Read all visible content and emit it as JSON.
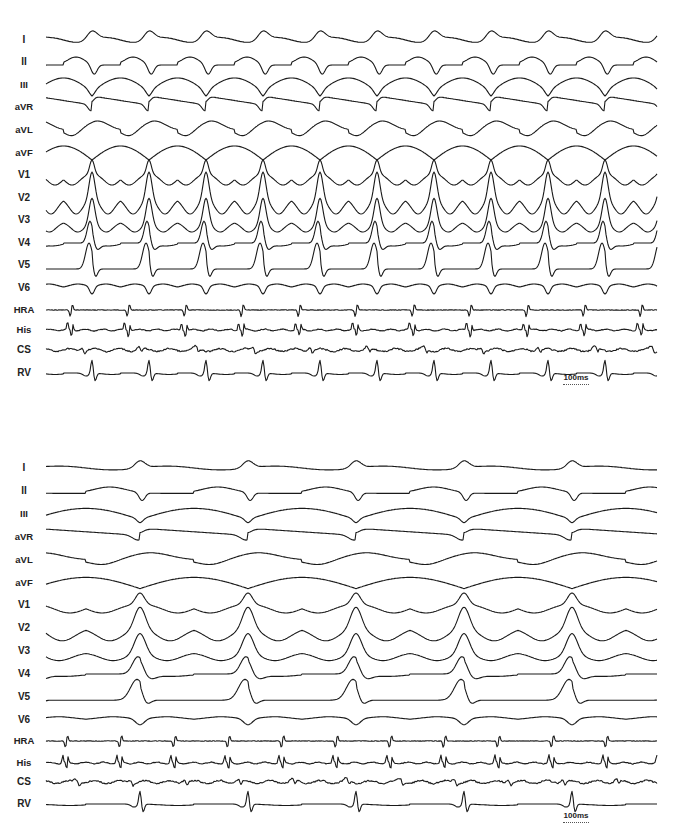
{
  "figure": {
    "panels": [
      {
        "id": "top",
        "description": "Wide QRS tachycardia, 1:1 AV relationship",
        "top": 0,
        "height": 400,
        "trace_start_x": 46,
        "trace_end_x": 657,
        "cycle_px": 57,
        "first_qrs_x": 92,
        "atrial_ratio": 1,
        "leads": [
          {
            "label": "I",
            "y": 40,
            "type": "ecg",
            "morph": "I"
          },
          {
            "label": "II",
            "y": 62,
            "type": "ecg",
            "morph": "II"
          },
          {
            "label": "III",
            "y": 85,
            "type": "ecg",
            "morph": "III"
          },
          {
            "label": "aVR",
            "y": 107,
            "type": "ecg",
            "morph": "aVR"
          },
          {
            "label": "aVL",
            "y": 130,
            "type": "ecg",
            "morph": "aVL"
          },
          {
            "label": "aVF",
            "y": 153,
            "type": "ecg",
            "morph": "aVF"
          },
          {
            "label": "V1",
            "y": 175,
            "type": "ecg",
            "morph": "V1"
          },
          {
            "label": "V2",
            "y": 198,
            "type": "ecg",
            "morph": "V2"
          },
          {
            "label": "V3",
            "y": 220,
            "type": "ecg",
            "morph": "V3"
          },
          {
            "label": "V4",
            "y": 243,
            "type": "ecg",
            "morph": "V4"
          },
          {
            "label": "V5",
            "y": 265,
            "type": "ecg",
            "morph": "V5"
          },
          {
            "label": "V6",
            "y": 288,
            "type": "ecg",
            "morph": "V6"
          },
          {
            "label": "HRA",
            "y": 310,
            "type": "egm",
            "morph": "HRA"
          },
          {
            "label": "His",
            "y": 330,
            "type": "egm",
            "morph": "His"
          },
          {
            "label": "CS",
            "y": 350,
            "type": "egm",
            "morph": "CS"
          },
          {
            "label": "RV",
            "y": 373,
            "type": "egm",
            "morph": "RV"
          }
        ],
        "scale_bar": {
          "label": "100ms",
          "x": 563,
          "y": 384,
          "width": 26
        }
      },
      {
        "id": "bottom",
        "description": "Same wide QRS morphology with 2:1 conduction (atrial cycle half of ventricular cycle)",
        "top": 0,
        "height": 837,
        "trace_start_x": 46,
        "trace_end_x": 657,
        "cycle_px": 108,
        "first_qrs_x": 140,
        "atrial_ratio": 2,
        "leads": [
          {
            "label": "I",
            "y": 468,
            "type": "ecg",
            "morph": "I"
          },
          {
            "label": "II",
            "y": 491,
            "type": "ecg",
            "morph": "II"
          },
          {
            "label": "III",
            "y": 514,
            "type": "ecg",
            "morph": "III"
          },
          {
            "label": "aVR",
            "y": 537,
            "type": "ecg",
            "morph": "aVR"
          },
          {
            "label": "aVL",
            "y": 560,
            "type": "ecg",
            "morph": "aVL"
          },
          {
            "label": "aVF",
            "y": 583,
            "type": "ecg",
            "morph": "aVF"
          },
          {
            "label": "V1",
            "y": 605,
            "type": "ecg",
            "morph": "V1"
          },
          {
            "label": "V2",
            "y": 628,
            "type": "ecg",
            "morph": "V2"
          },
          {
            "label": "V3",
            "y": 651,
            "type": "ecg",
            "morph": "V3"
          },
          {
            "label": "V4",
            "y": 674,
            "type": "ecg",
            "morph": "V4"
          },
          {
            "label": "V5",
            "y": 697,
            "type": "ecg",
            "morph": "V5"
          },
          {
            "label": "V6",
            "y": 720,
            "type": "ecg",
            "morph": "V6"
          },
          {
            "label": "HRA",
            "y": 741,
            "type": "egm",
            "morph": "HRA"
          },
          {
            "label": "His",
            "y": 763,
            "type": "egm",
            "morph": "His"
          },
          {
            "label": "CS",
            "y": 782,
            "type": "egm",
            "morph": "CS"
          },
          {
            "label": "RV",
            "y": 804,
            "type": "egm",
            "morph": "RV"
          }
        ],
        "scale_bar": {
          "label": "100ms",
          "x": 563,
          "y": 822,
          "width": 26
        }
      }
    ]
  },
  "chart_data": [
    {
      "type": "line",
      "title": "",
      "subtitle": "Top tracing: 12-lead ECG + intracardiac electrograms during tachycardia",
      "xlabel": "time",
      "ylabel": "",
      "grid": false,
      "legend": "none",
      "channels": [
        "I",
        "II",
        "III",
        "aVR",
        "aVL",
        "aVF",
        "V1",
        "V2",
        "V3",
        "V4",
        "V5",
        "V6",
        "HRA",
        "His",
        "CS",
        "RV"
      ],
      "scale_bar": "100ms",
      "qrs_positions_px": [
        92,
        149,
        206,
        263,
        320,
        377,
        434,
        491,
        548,
        605
      ],
      "approx_cycle_length_ms": 260,
      "av_relationship": "1:1"
    },
    {
      "type": "line",
      "title": "",
      "subtitle": "Bottom tracing: same channels, 2:1 conduction",
      "xlabel": "time",
      "ylabel": "",
      "grid": false,
      "legend": "none",
      "channels": [
        "I",
        "II",
        "III",
        "aVR",
        "aVL",
        "aVF",
        "V1",
        "V2",
        "V3",
        "V4",
        "V5",
        "V6",
        "HRA",
        "His",
        "CS",
        "RV"
      ],
      "scale_bar": "100ms",
      "qrs_positions_px": [
        140,
        250,
        358,
        466,
        574
      ],
      "approx_ventricular_cycle_length_ms": 490,
      "approx_atrial_cycle_length_ms": 245,
      "av_relationship": "2:1"
    }
  ]
}
